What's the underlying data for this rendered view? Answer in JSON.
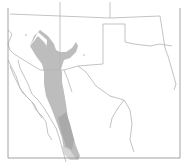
{
  "map": {
    "title": "",
    "type": "species-range-map",
    "region": "Southwestern United States and Northern Mexico",
    "colors": {
      "background": "#ffffff",
      "border_line": "#b4b4b4",
      "range_fill": "#bdbdbd",
      "range_fill_dark": "#aaaaaa",
      "range_fill_light": "#d6d6d6",
      "frame": "#8c8c8c"
    },
    "regions_shown": [
      "Arizona",
      "New Mexico",
      "Texas",
      "Oklahoma",
      "Colorado",
      "Utah",
      "Baja California",
      "Sonora",
      "Chihuahua",
      "Coahuila"
    ],
    "range_note": "Shaded area indicates distribution range"
  }
}
